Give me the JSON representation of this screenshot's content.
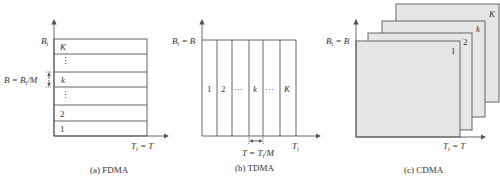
{
  "panels": {
    "fdma": {
      "caption": "(a) FDMA",
      "y_axis_label": "B",
      "y_axis_sub": "t",
      "x_axis_label": "T",
      "x_axis_sub": "t",
      "x_axis_eq": " = T",
      "band_label": "B = B",
      "band_label_sub": "t",
      "band_label_tail": "/M",
      "rows": [
        "K",
        "⋮",
        "k",
        "⋮",
        "2",
        "1"
      ]
    },
    "tdma": {
      "caption": "(b) TDMA",
      "y_axis_label": "B",
      "y_axis_sub": "t",
      "y_axis_eq": " = B",
      "x_axis_label": "T",
      "x_axis_sub": "t",
      "slot_label": "T = T",
      "slot_label_sub": "t",
      "slot_label_tail": "/M",
      "columns": [
        "1",
        "2",
        "···",
        "k",
        "···",
        "K"
      ]
    },
    "cdma": {
      "caption": "(c) CDMA",
      "y_axis_label": "B",
      "y_axis_sub": "t",
      "y_axis_eq": " = B",
      "x_axis_label": "T",
      "x_axis_sub": "t",
      "x_axis_eq": " = T",
      "plates": [
        "K",
        "k",
        "2",
        "1"
      ]
    }
  },
  "colors": {
    "line": "#555555",
    "plate_fill": "#e6e6e6",
    "text": "#333333"
  }
}
